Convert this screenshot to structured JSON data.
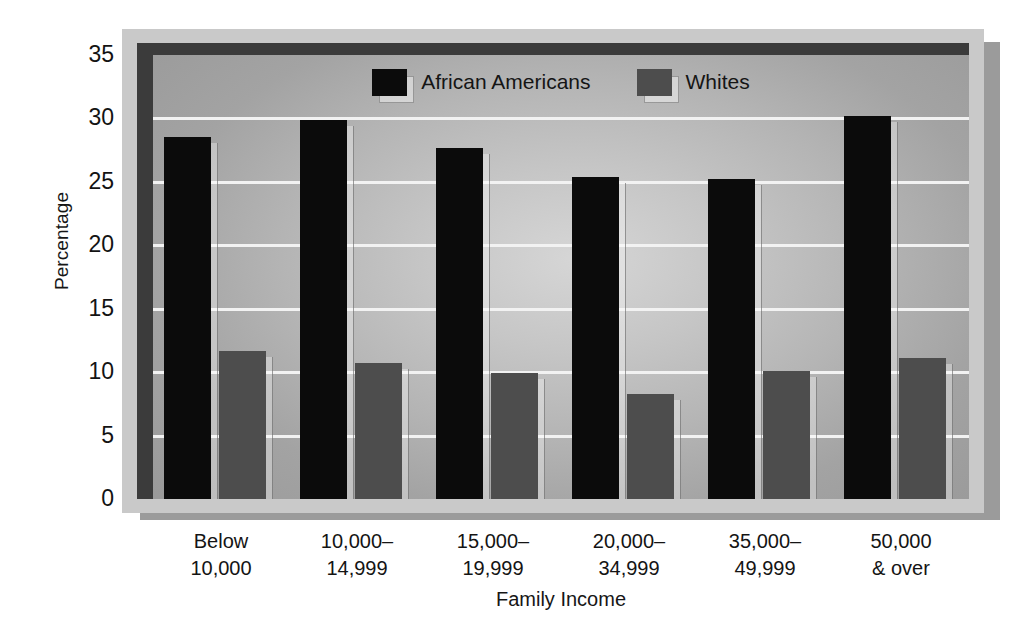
{
  "chart_data": {
    "type": "bar",
    "title": "",
    "xlabel": "Family Income",
    "ylabel": "Percentage",
    "ylim": [
      0,
      35
    ],
    "ytick_step": 5,
    "yticks": [
      35,
      30,
      25,
      20,
      15,
      10,
      5,
      0
    ],
    "grid": true,
    "legend_position": "top-center",
    "categories": [
      "Below\n10,000",
      "10,000–\n14,999",
      "15,000–\n19,999",
      "20,000–\n34,999",
      "35,000–\n49,999",
      "50,000\n& over"
    ],
    "category_lines": [
      [
        "Below",
        "10,000"
      ],
      [
        "10,000–",
        "14,999"
      ],
      [
        "15,000–",
        "19,999"
      ],
      [
        "20,000–",
        "34,999"
      ],
      [
        "35,000–",
        "49,999"
      ],
      [
        "50,000",
        "& over"
      ]
    ],
    "series": [
      {
        "name": "African Americans",
        "color": "#0b0b0b",
        "values": [
          28.5,
          29.9,
          27.7,
          25.4,
          25.2,
          30.2
        ]
      },
      {
        "name": "Whites",
        "color": "#4d4d4d",
        "values": [
          11.7,
          10.7,
          9.9,
          8.3,
          10.1,
          11.1
        ]
      }
    ]
  },
  "legend": {
    "entries": [
      {
        "label": "African Americans",
        "swatch": "black"
      },
      {
        "label": "Whites",
        "swatch": "gray"
      }
    ]
  },
  "axes": {
    "y_title": "Percentage",
    "x_title": "Family Income"
  },
  "colors": {
    "series_black": "#0b0b0b",
    "series_gray": "#4d4d4d",
    "plot_bg_center": "#d6d6d6",
    "plot_bg_edge": "#9a9a9a",
    "frame": "#c9c9c9",
    "frame_border": "#3b3b3b",
    "gridline": "#f2f2f2",
    "shadow": "#9b9b9b"
  }
}
